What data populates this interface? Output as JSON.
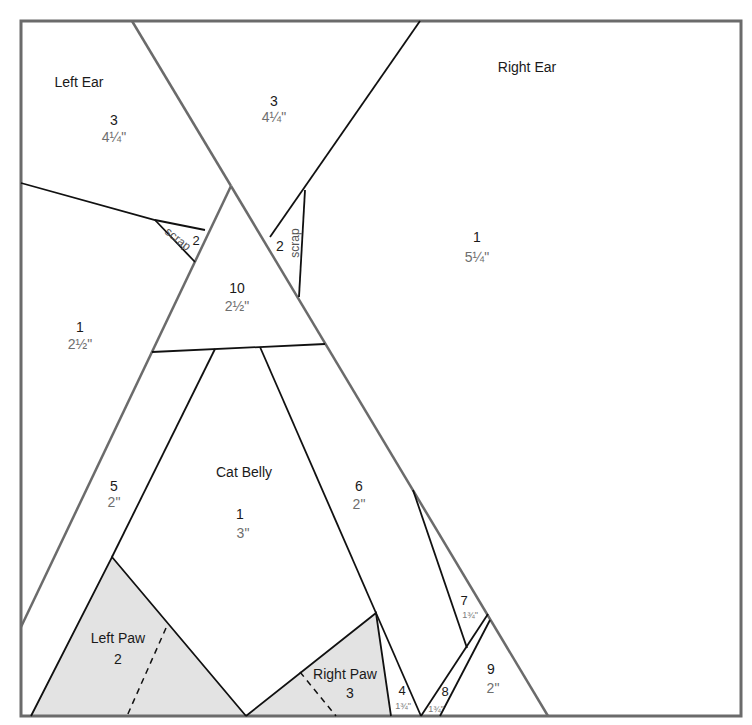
{
  "diagram": {
    "type": "quilt-foundation-paper-piecing-pattern",
    "colors": {
      "frame": "#6b6b6b",
      "section_line": "#6b6b6b",
      "seam_line": "#111111",
      "paw_fill": "#e3e3e3",
      "text": "#1a1a1a",
      "size_text": "#6e6e6e"
    },
    "sections": {
      "left_ear": {
        "name": "Left Ear",
        "pieces": [
          {
            "num": "3",
            "size": "4¼\""
          },
          {
            "num": "2",
            "size": "scrap"
          },
          {
            "num": "1",
            "size": "2½\""
          }
        ]
      },
      "center_top": {
        "pieces": [
          {
            "num": "3",
            "size": "4¼\""
          },
          {
            "num": "10",
            "size": "2½\""
          }
        ]
      },
      "right_ear": {
        "name": "Right Ear",
        "pieces": [
          {
            "num": "1",
            "size": "5¼\""
          },
          {
            "num": "2",
            "size": "scrap"
          }
        ]
      },
      "cat_belly": {
        "name": "Cat Belly",
        "pieces": [
          {
            "num": "1",
            "size": "3\""
          },
          {
            "num": "5",
            "size": "2\""
          },
          {
            "num": "6",
            "size": "2\""
          },
          {
            "num": "7",
            "size": "1¾\""
          },
          {
            "num": "4",
            "size": "1¾\""
          },
          {
            "num": "8",
            "size": "1¾\""
          },
          {
            "num": "9",
            "size": "2\""
          }
        ]
      },
      "left_paw": {
        "name": "Left Paw",
        "num": "2"
      },
      "right_paw": {
        "name": "Right Paw",
        "num": "3"
      }
    }
  }
}
